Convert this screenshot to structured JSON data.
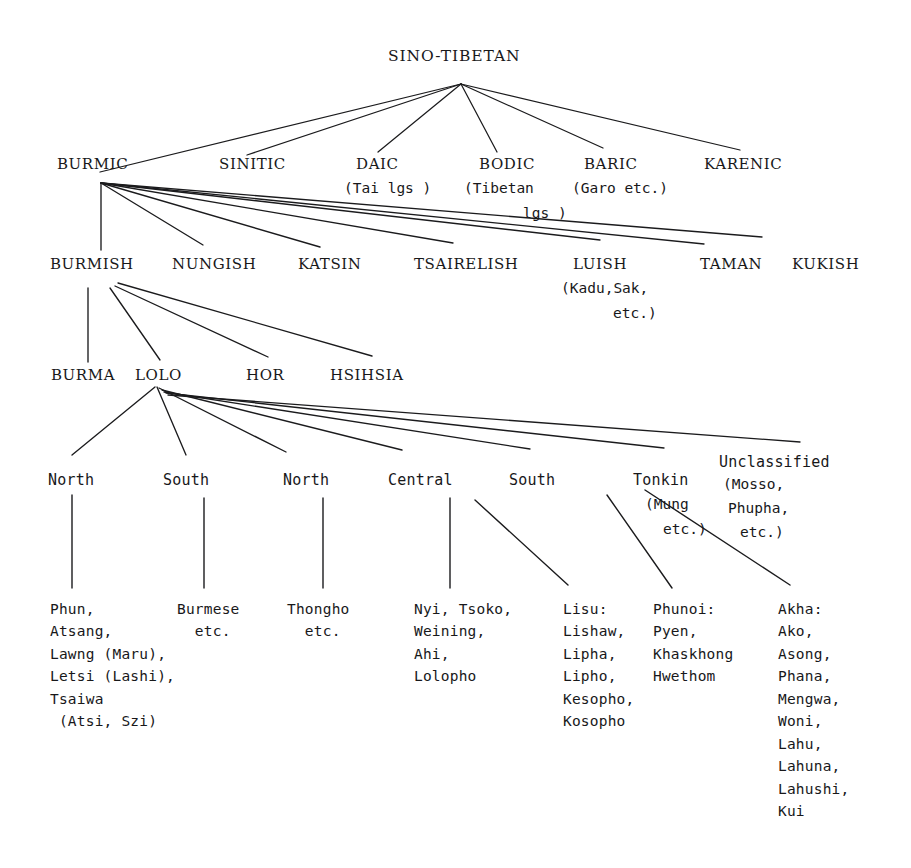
{
  "figure": {
    "title": "SINO-TIBETAN",
    "type": "tree-diagram",
    "ink_color": "#18181a",
    "background": "#ffffff"
  },
  "root": {
    "label": "SINO-TIBETAN"
  },
  "level2": [
    {
      "label": "BURMIC",
      "gloss": ""
    },
    {
      "label": "SINITIC",
      "gloss": ""
    },
    {
      "label": "DAIC",
      "gloss": "(Tai lgs )"
    },
    {
      "label": "BODIC",
      "gloss": "(Tibetan",
      "gloss2": "lgs )"
    },
    {
      "label": "BARIC",
      "gloss": "(Garo etc.)"
    },
    {
      "label": "KARENIC",
      "gloss": ""
    }
  ],
  "level3": [
    {
      "label": "BURMISH",
      "gloss": ""
    },
    {
      "label": "NUNGISH",
      "gloss": ""
    },
    {
      "label": "KATSIN",
      "gloss": ""
    },
    {
      "label": "TSAIRELISH",
      "gloss": ""
    },
    {
      "label": "LUISH",
      "gloss": "(Kadu,Sak,",
      "gloss2": "etc.)"
    },
    {
      "label": "TAMAN",
      "gloss": ""
    },
    {
      "label": "KUKISH",
      "gloss": ""
    }
  ],
  "level4": [
    {
      "label": "BURMA"
    },
    {
      "label": "LOLO"
    },
    {
      "label": "HOR"
    },
    {
      "label": "HSIHSIA"
    }
  ],
  "level5": [
    {
      "label": "North",
      "gloss": ""
    },
    {
      "label": "South",
      "gloss": ""
    },
    {
      "label": "North",
      "gloss": ""
    },
    {
      "label": "Central",
      "gloss": ""
    },
    {
      "label": "South",
      "gloss": ""
    },
    {
      "label": "Tonkin",
      "gloss": "(Mung",
      "gloss2": "etc.)"
    },
    {
      "label": "Unclassified",
      "gloss": "(Mosso,",
      "gloss2": "Phupha,",
      "gloss3": "etc.)"
    }
  ],
  "leaves": [
    {
      "name": "burma-north-leaf",
      "text": "Phun,\nAtsang,\nLawng (Maru),\nLetsi (Lashi),\nTsaiwa\n (Atsi, Szi)"
    },
    {
      "name": "burma-south-leaf",
      "text": "Burmese\n  etc."
    },
    {
      "name": "lolo-north-leaf",
      "text": "Thongho\n  etc."
    },
    {
      "name": "lolo-central-leaf",
      "text": "Nyi, Tsoko,\nWeining,\nAhi,\nLolopho"
    },
    {
      "name": "lolo-south-leaf",
      "text": "Lisu:\nLishaw,\nLipha,\nLipho,\nKesopho,\nKosopho"
    },
    {
      "name": "lolo-tonkin-leaf",
      "text": "Phunoi:\nPyen,\nKhaskhong\nHwethom"
    },
    {
      "name": "lolo-unclass-leaf",
      "text": "Akha:\nAko,\nAsong,\nPhana,\nMengwa,\nWoni,\nLahu,\nLahuna,\nLahushi,\nKui"
    }
  ]
}
